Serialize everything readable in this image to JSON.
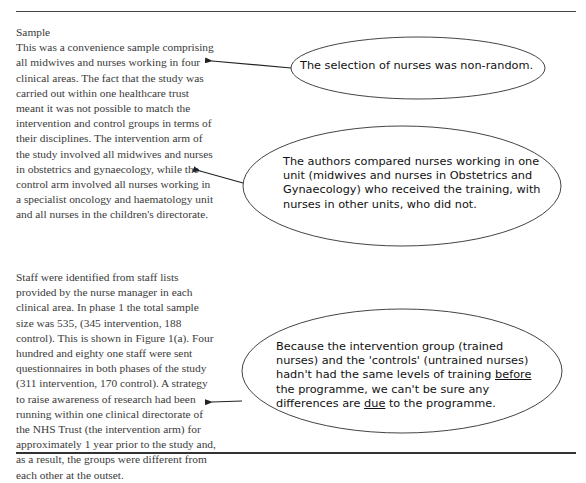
{
  "document": {
    "section_heading": "Sample",
    "paragraphs": [
      "This was a convenience sample comprising all midwives and nurses working in four clinical areas. The fact that the study was carried out within one healthcare trust meant it was not possible to match the intervention and control groups in terms of their disciplines. The intervention arm of the study involved all midwives and nurses in obstetrics and gynaecology, while the control arm involved all nurses working in a specialist oncology and haematology unit and all nurses in the children's directorate.",
      "Staff were identified from staff lists provided by the nurse manager in each clinical area. In phase 1 the total sample size was 535, (345 intervention, 188 control). This is shown in Figure 1(a). Four hundred and eighty one staff were sent questionnaires in both phases of the study (311 intervention, 170 control). A strategy to raise awareness of research had been running within one clinical directorate of the NHS Trust (the intervention arm) for approximately 1 year prior to the study and, as a result, the groups were different from each other at the outset."
    ]
  },
  "annotations": [
    {
      "lines": [
        "The selection of nurses was non-random."
      ]
    },
    {
      "lines": [
        "The authors compared nurses working in one",
        "unit (midwives and nurses in Obstetrics and",
        "Gynaecology) who received the training, with",
        "nurses in other units, who did not."
      ]
    },
    {
      "line1": "Because the intervention group (trained",
      "line2": "nurses) and the 'controls' (untrained nurses)",
      "line3_pre": "hadn't had the same levels of training ",
      "line3_underlined": "before",
      "line4": "the programme, we can't be sure any",
      "line5_pre": "differences are ",
      "line5_underlined": "due",
      "line5_post": " to the programme."
    }
  ],
  "colors": {
    "text": "#3a3a3a",
    "annotation_text": "#111111",
    "lines": "#333333"
  }
}
